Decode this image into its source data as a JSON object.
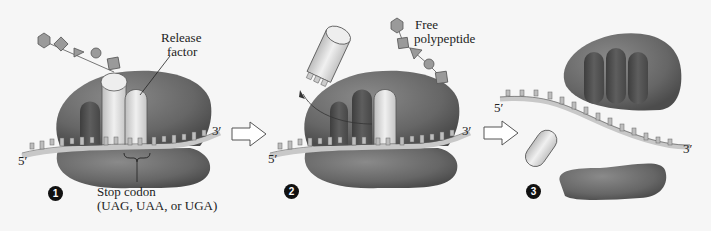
{
  "figure": {
    "colors": {
      "background": "#f6f6f6",
      "ribosome": "#6e6e6e",
      "ribosome_dark": "#4a4a4a",
      "trna": "#d8d8d8",
      "release_factor": "#e6e6e6",
      "mrna": "#cfcfcf",
      "polypeptide": "#9a9a9a"
    }
  },
  "panels": [
    {
      "step": "1",
      "labels": {
        "release_factor": "Release\nfactor",
        "release_factor_line1": "Release",
        "release_factor_line2": "factor",
        "stop_codon_line1": "Stop codon",
        "stop_codon_line2": "(UAG, UAA, or UGA)",
        "five_prime": "5′",
        "three_prime": "3′"
      }
    },
    {
      "step": "2",
      "labels": {
        "free_polypeptide_line1": "Free",
        "free_polypeptide_line2": "polypeptide",
        "five_prime": "5′",
        "three_prime": "3′"
      }
    },
    {
      "step": "3",
      "labels": {
        "five_prime": "5′",
        "three_prime": "3′"
      }
    }
  ]
}
